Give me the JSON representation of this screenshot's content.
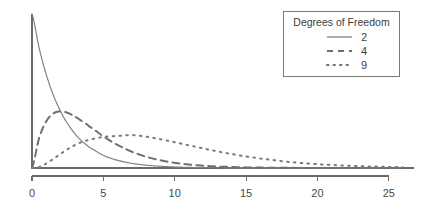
{
  "chart_data": {
    "type": "line",
    "title": "",
    "subtitle": "",
    "xlabel": "",
    "ylabel": "",
    "distribution": "chi-square probability density",
    "xlim": [
      0,
      26
    ],
    "ylim": [
      0,
      0.5
    ],
    "grid": false,
    "x_ticks": [
      0,
      5,
      10,
      15,
      20,
      25
    ],
    "x_tick_labels": [
      "0",
      "5",
      "10",
      "15",
      "20",
      "25"
    ],
    "y_ticks": [],
    "y_tick_labels": [],
    "y_axis_visible": true,
    "legend": {
      "position": "top-right",
      "title": "Degrees of Freedom",
      "entries": [
        {
          "label": "2",
          "df": 2,
          "style": "solid"
        },
        {
          "label": "4",
          "df": 4,
          "style": "dashed"
        },
        {
          "label": "9",
          "df": 9,
          "style": "dotted"
        }
      ]
    },
    "series": [
      {
        "name": "2",
        "df": 2,
        "style": "solid",
        "color": "#7d7d7d",
        "peak": {
          "x": 0,
          "y": 0.5
        },
        "x": [
          0,
          0.5,
          1,
          1.5,
          2,
          2.5,
          3,
          3.5,
          4,
          5,
          6,
          7,
          8,
          9,
          10,
          11,
          12,
          13,
          14,
          15,
          16,
          18,
          20,
          22,
          24,
          26
        ],
        "y": [
          0.5,
          0.3894,
          0.3033,
          0.2362,
          0.1839,
          0.1433,
          0.1116,
          0.0869,
          0.0677,
          0.041,
          0.0249,
          0.0151,
          0.0092,
          0.0056,
          0.0034,
          0.002,
          0.0012,
          0.0008,
          0.0005,
          0.0003,
          0.0002,
          0.0001,
          0.0,
          0.0,
          0.0,
          0.0
        ]
      },
      {
        "name": "4",
        "df": 4,
        "style": "dashed",
        "color": "#6f6f6f",
        "peak": {
          "x": 2,
          "y": 0.1839
        },
        "x": [
          0,
          0.5,
          1,
          1.5,
          2,
          2.5,
          3,
          3.5,
          4,
          5,
          6,
          7,
          8,
          9,
          10,
          11,
          12,
          13,
          14,
          15,
          16,
          18,
          20,
          22,
          24,
          26
        ],
        "y": [
          0.0,
          0.0974,
          0.1516,
          0.1772,
          0.1839,
          0.1791,
          0.1673,
          0.1521,
          0.1353,
          0.1026,
          0.0747,
          0.0528,
          0.0366,
          0.025,
          0.0169,
          0.0113,
          0.0074,
          0.0048,
          0.0031,
          0.002,
          0.0013,
          0.0005,
          0.0002,
          0.0001,
          0.0,
          0.0
        ]
      },
      {
        "name": "9",
        "df": 9,
        "style": "dotted",
        "color": "#7a7a7a",
        "peak": {
          "x": 7,
          "y": 0.1069
        },
        "x": [
          0,
          0.5,
          1,
          1.5,
          2,
          2.5,
          3,
          3.5,
          4,
          5,
          6,
          7,
          8,
          9,
          10,
          11,
          12,
          13,
          14,
          15,
          16,
          18,
          20,
          22,
          24,
          26
        ],
        "y": [
          0.0,
          0.0033,
          0.0145,
          0.0296,
          0.0459,
          0.0612,
          0.0743,
          0.0845,
          0.0918,
          0.1009,
          0.1041,
          0.1069,
          0.1017,
          0.0935,
          0.0838,
          0.0736,
          0.0635,
          0.0539,
          0.0452,
          0.0374,
          0.0306,
          0.0198,
          0.0125,
          0.0077,
          0.0047,
          0.0028
        ]
      }
    ]
  },
  "colors": {
    "axis": "#6a6a6a",
    "tick_label": "#4a4a4a",
    "legend_border": "#7a7a7a",
    "legend_text": "#3d3d3d",
    "background": "#ffffff"
  }
}
